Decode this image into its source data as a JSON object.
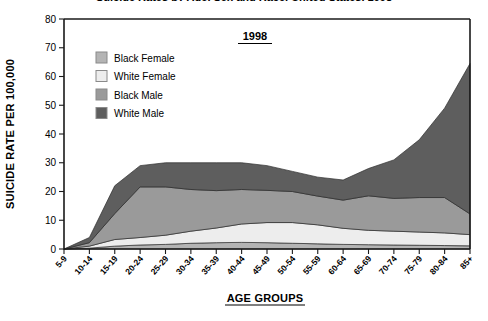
{
  "figure": {
    "year_label": "1998",
    "clipped_title": "Suicide Rates by Age, Sex and Race, United States, 1998"
  },
  "axes": {
    "ylabel": "SUICIDE RATE PER 100,000",
    "xlabel": "AGE GROUPS",
    "yticks": [
      "0",
      "10",
      "20",
      "30",
      "40",
      "50",
      "60",
      "70",
      "80"
    ]
  },
  "legend": {
    "items": [
      {
        "label": "Black Female",
        "color": "#b4b4b4"
      },
      {
        "label": "White Female",
        "color": "#ededed"
      },
      {
        "label": "Black Male",
        "color": "#9a9a9a"
      },
      {
        "label": "White Male",
        "color": "#5e5e5e"
      }
    ]
  },
  "chart_data": {
    "type": "area",
    "stacked": true,
    "title": "Suicide Rates by Age, Sex and Race, United States, 1998",
    "annotation": "1998",
    "xlabel": "AGE GROUPS",
    "ylabel": "SUICIDE RATE PER 100,000",
    "ylim": [
      0,
      80
    ],
    "ytick_step": 10,
    "grid": false,
    "legend_position": "inside-top-left",
    "categories": [
      "5-9",
      "10-14",
      "15-19",
      "20-24",
      "25-29",
      "30-34",
      "35-39",
      "40-44",
      "45-49",
      "50-54",
      "55-59",
      "60-64",
      "65-69",
      "70-74",
      "75-79",
      "80-84",
      "85+"
    ],
    "series": [
      {
        "name": "Black Female",
        "color": "#b4b4b4",
        "values": [
          0.0,
          0.3,
          1.0,
          1.4,
          1.6,
          2.0,
          2.2,
          2.3,
          2.2,
          2.0,
          1.8,
          1.6,
          1.5,
          1.4,
          1.3,
          1.2,
          1.1
        ]
      },
      {
        "name": "White Female",
        "color": "#ededed",
        "values": [
          0.0,
          0.7,
          2.3,
          2.6,
          3.2,
          4.2,
          5.1,
          6.4,
          7.0,
          7.2,
          6.6,
          5.6,
          5.0,
          4.8,
          4.6,
          4.4,
          3.9
        ]
      },
      {
        "name": "Black Male",
        "color": "#9a9a9a",
        "values": [
          0.0,
          1.2,
          9.0,
          17.6,
          16.8,
          14.5,
          13.0,
          12.0,
          11.2,
          10.8,
          10.0,
          9.8,
          12.0,
          11.4,
          12.0,
          12.3,
          7.2
        ]
      },
      {
        "name": "White Male",
        "color": "#5e5e5e",
        "values": [
          0.0,
          1.8,
          9.7,
          7.4,
          8.4,
          9.3,
          9.7,
          9.3,
          8.6,
          7.0,
          6.6,
          7.0,
          9.5,
          13.4,
          20.1,
          31.1,
          52.3
        ]
      }
    ],
    "totals": [
      0.0,
      4.0,
      22.0,
      29.0,
      30.0,
      30.0,
      30.0,
      30.0,
      29.0,
      27.0,
      25.0,
      24.0,
      28.0,
      31.0,
      38.0,
      49.0,
      64.5
    ]
  }
}
